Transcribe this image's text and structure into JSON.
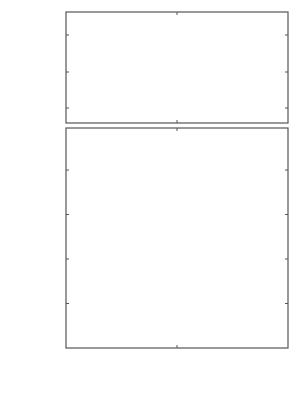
{
  "chart_data": [
    {
      "type": "line",
      "panel": "top",
      "xlabel": "",
      "ylabel": "ω , cm⁻¹",
      "ylim": [
        480,
        631
      ],
      "xlim": [
        0,
        3.1416
      ],
      "yticks": [
        500,
        550,
        600
      ],
      "grid": false,
      "x_fraction_of_pi": [
        0,
        0.05,
        0.1,
        0.15,
        0.2,
        0.25,
        0.3,
        0.35,
        0.4,
        0.45,
        0.5,
        0.55,
        0.6,
        0.65,
        0.7,
        0.75,
        0.8,
        0.85,
        0.9,
        0.95,
        1.0
      ],
      "series": [
        {
          "name": "3",
          "values": [
            515,
            513,
            508,
            501,
            493,
            487,
            484,
            486,
            494,
            507,
            523,
            542,
            562,
            580,
            596,
            609,
            619,
            625,
            628,
            630,
            630
          ]
        }
      ],
      "annotations": [
        {
          "text": "3",
          "x_fraction_of_pi": 0.64,
          "y": 592
        }
      ]
    },
    {
      "type": "line",
      "panel": "bottom",
      "xlabel": "q",
      "ylabel": "ω , cm⁻¹",
      "ylim": [
        0,
        247
      ],
      "xlim": [
        0,
        3.1416
      ],
      "yticks": [
        0,
        50,
        100,
        150,
        200
      ],
      "xticks": [
        "0",
        "π/2",
        "π"
      ],
      "grid": false,
      "x_fraction_of_pi": [
        0,
        0.05,
        0.1,
        0.15,
        0.2,
        0.25,
        0.3,
        0.35,
        0.4,
        0.45,
        0.5,
        0.55,
        0.6,
        0.65,
        0.7,
        0.75,
        0.8,
        0.85,
        0.9,
        0.95,
        1.0
      ],
      "series": [
        {
          "name": "1",
          "values": [
            0,
            30,
            60,
            88,
            112,
            133,
            150,
            161,
            166,
            165,
            158,
            146,
            130,
            111,
            90,
            68,
            46,
            26,
            10,
            1,
            11
          ]
        },
        {
          "name": "2",
          "values": [
            0,
            42,
            84,
            124,
            160,
            191,
            215,
            232,
            242,
            244,
            238,
            224,
            205,
            180,
            152,
            122,
            91,
            62,
            36,
            17,
            11
          ]
        }
      ],
      "annotations": [
        {
          "text": "1",
          "x_fraction_of_pi": 0.43,
          "y": 170
        },
        {
          "text": "2",
          "x_fraction_of_pi": 0.54,
          "y": 230
        }
      ]
    }
  ],
  "labels": {
    "top_yticks": [
      "600",
      "550",
      "500"
    ],
    "bottom_yticks": [
      "200",
      "150",
      "100",
      "50",
      "0"
    ],
    "xticks": [
      "0",
      "π/2",
      "π"
    ],
    "xlabel": "q",
    "ylabel_top_omega": "ω , cm",
    "ylabel_top_exp": "−1",
    "ylabel_bottom_omega": "ω , cm",
    "ylabel_bottom_exp": "−1",
    "curve1": "1",
    "curve2": "2",
    "curve3": "3"
  }
}
